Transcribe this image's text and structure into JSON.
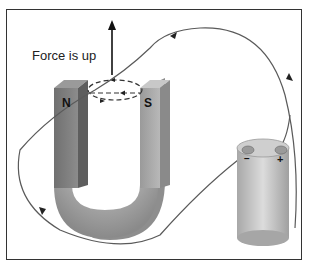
{
  "diagram": {
    "force_label": "Force is up",
    "north_pole_label": "N",
    "south_pole_label": "S",
    "battery_negative": "−",
    "battery_positive": "+",
    "colors": {
      "magnet_dark": "#6e6e6e",
      "magnet_light": "#b0b0b0",
      "wire": "#555555",
      "battery": "#c4c4c4",
      "frame": "#333333"
    }
  }
}
